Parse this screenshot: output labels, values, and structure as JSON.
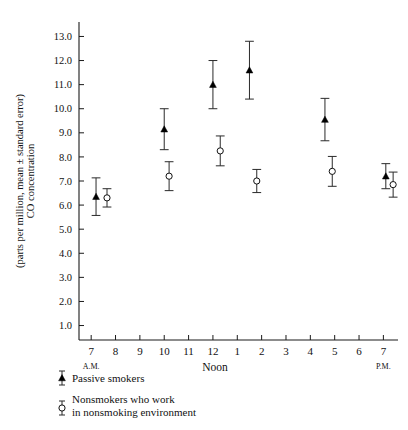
{
  "chart_data": {
    "type": "scatter",
    "title": "",
    "xlabel": "Noon",
    "ylabel": "CO concentration (parts per million, mean ± standard error)",
    "ylabel_line1": "CO concentration",
    "ylabel_line2": "(parts per million, mean ± standard error)",
    "ylim": [
      0.4,
      13.6
    ],
    "yticks": [
      "1.0",
      "2.0",
      "3.0",
      "4.0",
      "5.0",
      "6.0",
      "7.0",
      "8.0",
      "9.0",
      "10.0",
      "11.0",
      "12.0",
      "13.0"
    ],
    "ytick_values": [
      1.0,
      2.0,
      3.0,
      4.0,
      5.0,
      6.0,
      7.0,
      8.0,
      9.0,
      10.0,
      11.0,
      12.0,
      13.0
    ],
    "xticks": [
      "7",
      "8",
      "9",
      "10",
      "11",
      "12",
      "1",
      "2",
      "3",
      "4",
      "5",
      "6",
      "7"
    ],
    "xtick_values": [
      7,
      8,
      9,
      10,
      11,
      12,
      13,
      14,
      15,
      16,
      17,
      18,
      19
    ],
    "xlim": [
      6.5,
      19.6
    ],
    "xaxis_start_label": "A.M.",
    "xaxis_mid_label": "Noon",
    "xaxis_end_label": "P.M.",
    "grid": false,
    "legend_position": "below-axis",
    "error_type": "standard error",
    "series": [
      {
        "name": "Passive smokers",
        "marker": "filled-triangle",
        "points": [
          {
            "x": 7.2,
            "y": 6.35,
            "err": 0.78
          },
          {
            "x": 10.0,
            "y": 9.15,
            "err": 0.85
          },
          {
            "x": 12.0,
            "y": 11.0,
            "err": 1.0
          },
          {
            "x": 13.5,
            "y": 11.6,
            "err": 1.2
          },
          {
            "x": 16.6,
            "y": 9.55,
            "err": 0.88
          },
          {
            "x": 19.1,
            "y": 7.2,
            "err": 0.52
          }
        ]
      },
      {
        "name": "Nonsmokers who work in nonsmoking environment",
        "name_line1": "Nonsmokers who work",
        "name_line2": "in nonsmoking environment",
        "marker": "open-circle",
        "points": [
          {
            "x": 7.65,
            "y": 6.3,
            "err": 0.38
          },
          {
            "x": 10.2,
            "y": 7.2,
            "err": 0.6
          },
          {
            "x": 12.3,
            "y": 8.25,
            "err": 0.62
          },
          {
            "x": 13.8,
            "y": 7.0,
            "err": 0.48
          },
          {
            "x": 16.9,
            "y": 7.4,
            "err": 0.62
          },
          {
            "x": 19.4,
            "y": 6.85,
            "err": 0.52
          }
        ]
      }
    ]
  },
  "legend": {
    "entries": [
      {
        "label": "Passive smokers",
        "marker": "filled-triangle"
      },
      {
        "label_line1": "Nonsmokers who work",
        "label_line2": "in nonsmoking environment",
        "marker": "open-circle"
      }
    ]
  },
  "colors": {
    "axis": "#1a1a1a",
    "marker_filled": "#000000",
    "marker_open_fill": "#ffffff",
    "marker_open_stroke": "#111111",
    "background": "#ffffff"
  }
}
